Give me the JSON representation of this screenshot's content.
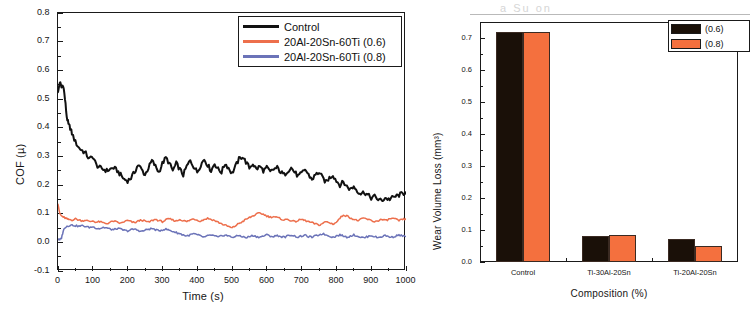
{
  "figure": {
    "ghost_text": "a Su on",
    "panels": [
      "cof-line-chart",
      "wear-bar-chart"
    ]
  },
  "chart_data": [
    {
      "type": "line",
      "id": "cof-vs-time",
      "title": "",
      "xlabel": "Time (s)",
      "ylabel": "COF (µ)",
      "xlim": [
        0,
        1000
      ],
      "ylim": [
        -0.1,
        0.8
      ],
      "xticks": [
        0,
        100,
        200,
        300,
        400,
        500,
        600,
        700,
        800,
        900,
        1000
      ],
      "xticklabels": [
        "0",
        "100",
        "200",
        "300",
        "400",
        "500",
        "600",
        "700",
        "800",
        "900",
        "1000"
      ],
      "yticks": [
        -0.1,
        0.0,
        0.1,
        0.2,
        0.3,
        0.4,
        0.5,
        0.6,
        0.7,
        0.8
      ],
      "yticklabels": [
        "-0.1",
        "0.0",
        "0.1",
        "0.2",
        "0.3",
        "0.4",
        "0.5",
        "0.6",
        "0.7",
        "0.8"
      ],
      "grid": false,
      "legend_position": "top-right",
      "series": [
        {
          "name": "Control",
          "color": "#111111",
          "x": [
            0,
            5,
            10,
            15,
            20,
            25,
            30,
            35,
            40,
            50,
            60,
            70,
            80,
            90,
            100,
            110,
            120,
            130,
            140,
            150,
            160,
            170,
            180,
            190,
            200,
            210,
            220,
            230,
            240,
            250,
            260,
            270,
            280,
            290,
            300,
            310,
            320,
            330,
            340,
            350,
            360,
            370,
            380,
            390,
            400,
            410,
            420,
            430,
            440,
            450,
            460,
            470,
            480,
            490,
            500,
            510,
            520,
            530,
            540,
            550,
            560,
            570,
            580,
            590,
            600,
            610,
            620,
            630,
            640,
            650,
            660,
            670,
            680,
            690,
            700,
            710,
            720,
            730,
            740,
            750,
            760,
            770,
            780,
            790,
            800,
            810,
            820,
            830,
            840,
            850,
            860,
            870,
            880,
            890,
            900,
            910,
            920,
            930,
            940,
            950,
            960,
            970,
            980,
            990,
            1000
          ],
          "y": [
            0.52,
            0.56,
            0.54,
            0.55,
            0.5,
            0.44,
            0.41,
            0.4,
            0.38,
            0.35,
            0.33,
            0.32,
            0.31,
            0.29,
            0.3,
            0.27,
            0.26,
            0.255,
            0.25,
            0.255,
            0.26,
            0.25,
            0.235,
            0.22,
            0.215,
            0.225,
            0.245,
            0.27,
            0.255,
            0.235,
            0.26,
            0.285,
            0.265,
            0.245,
            0.275,
            0.295,
            0.275,
            0.25,
            0.275,
            0.255,
            0.235,
            0.265,
            0.285,
            0.265,
            0.245,
            0.27,
            0.29,
            0.27,
            0.25,
            0.275,
            0.255,
            0.245,
            0.275,
            0.26,
            0.24,
            0.265,
            0.29,
            0.3,
            0.28,
            0.26,
            0.275,
            0.255,
            0.265,
            0.25,
            0.26,
            0.245,
            0.255,
            0.26,
            0.245,
            0.235,
            0.25,
            0.26,
            0.245,
            0.23,
            0.24,
            0.255,
            0.235,
            0.22,
            0.235,
            0.245,
            0.225,
            0.21,
            0.225,
            0.235,
            0.215,
            0.2,
            0.21,
            0.195,
            0.185,
            0.195,
            0.18,
            0.17,
            0.175,
            0.165,
            0.155,
            0.16,
            0.15,
            0.145,
            0.155,
            0.15,
            0.155,
            0.16,
            0.165,
            0.17,
            0.175
          ]
        },
        {
          "name": "20Al-20Sn-60Ti (0.6)",
          "color": "#ED6F4C",
          "x": [
            0,
            5,
            10,
            15,
            20,
            25,
            30,
            40,
            50,
            60,
            70,
            80,
            90,
            100,
            110,
            120,
            130,
            140,
            150,
            160,
            170,
            180,
            190,
            200,
            210,
            220,
            230,
            240,
            250,
            260,
            270,
            280,
            290,
            300,
            310,
            320,
            330,
            340,
            350,
            360,
            370,
            380,
            390,
            400,
            410,
            420,
            430,
            440,
            450,
            460,
            470,
            480,
            490,
            500,
            510,
            520,
            530,
            540,
            550,
            560,
            570,
            580,
            590,
            600,
            610,
            620,
            630,
            640,
            650,
            660,
            670,
            680,
            690,
            700,
            710,
            720,
            730,
            740,
            750,
            760,
            770,
            780,
            790,
            800,
            810,
            820,
            830,
            840,
            850,
            860,
            870,
            880,
            890,
            900,
            910,
            920,
            930,
            940,
            950,
            960,
            970,
            980,
            990,
            1000
          ],
          "y": [
            0.135,
            0.1,
            0.092,
            0.088,
            0.085,
            0.082,
            0.08,
            0.078,
            0.082,
            0.078,
            0.075,
            0.078,
            0.072,
            0.075,
            0.07,
            0.072,
            0.068,
            0.065,
            0.07,
            0.074,
            0.07,
            0.066,
            0.072,
            0.076,
            0.072,
            0.068,
            0.074,
            0.078,
            0.074,
            0.07,
            0.076,
            0.08,
            0.076,
            0.072,
            0.078,
            0.082,
            0.078,
            0.074,
            0.08,
            0.076,
            0.072,
            0.078,
            0.082,
            0.078,
            0.074,
            0.08,
            0.084,
            0.08,
            0.076,
            0.07,
            0.065,
            0.06,
            0.055,
            0.05,
            0.058,
            0.066,
            0.072,
            0.08,
            0.086,
            0.092,
            0.098,
            0.102,
            0.098,
            0.092,
            0.088,
            0.09,
            0.086,
            0.082,
            0.078,
            0.08,
            0.076,
            0.072,
            0.076,
            0.08,
            0.076,
            0.072,
            0.068,
            0.064,
            0.06,
            0.066,
            0.072,
            0.068,
            0.064,
            0.07,
            0.084,
            0.096,
            0.092,
            0.086,
            0.08,
            0.076,
            0.08,
            0.084,
            0.08,
            0.076,
            0.072,
            0.076,
            0.08,
            0.076,
            0.08,
            0.084,
            0.08,
            0.076,
            0.08,
            0.082
          ]
        },
        {
          "name": "20Al-20Sn-60Ti (0.8)",
          "color": "#6B73B8",
          "x": [
            0,
            5,
            10,
            15,
            20,
            25,
            30,
            40,
            50,
            60,
            70,
            80,
            90,
            100,
            110,
            120,
            130,
            140,
            150,
            160,
            170,
            180,
            190,
            200,
            210,
            220,
            230,
            240,
            250,
            260,
            270,
            280,
            290,
            300,
            310,
            320,
            330,
            340,
            350,
            360,
            370,
            380,
            390,
            400,
            410,
            420,
            430,
            440,
            450,
            460,
            470,
            480,
            490,
            500,
            510,
            520,
            530,
            540,
            550,
            560,
            570,
            580,
            590,
            600,
            610,
            620,
            630,
            640,
            650,
            660,
            670,
            680,
            690,
            700,
            710,
            720,
            730,
            740,
            750,
            760,
            770,
            780,
            790,
            800,
            810,
            820,
            830,
            840,
            850,
            860,
            870,
            880,
            890,
            900,
            910,
            920,
            930,
            940,
            950,
            960,
            970,
            980,
            990,
            1000
          ],
          "y": [
            0.012,
            0.008,
            0.015,
            0.04,
            0.052,
            0.056,
            0.058,
            0.06,
            0.058,
            0.056,
            0.058,
            0.055,
            0.052,
            0.054,
            0.05,
            0.048,
            0.052,
            0.05,
            0.046,
            0.044,
            0.048,
            0.046,
            0.042,
            0.04,
            0.044,
            0.046,
            0.042,
            0.038,
            0.042,
            0.046,
            0.048,
            0.044,
            0.04,
            0.044,
            0.046,
            0.042,
            0.038,
            0.034,
            0.03,
            0.026,
            0.022,
            0.026,
            0.03,
            0.026,
            0.022,
            0.018,
            0.022,
            0.026,
            0.022,
            0.018,
            0.022,
            0.026,
            0.022,
            0.018,
            0.02,
            0.024,
            0.02,
            0.016,
            0.02,
            0.024,
            0.02,
            0.018,
            0.022,
            0.026,
            0.022,
            0.02,
            0.024,
            0.02,
            0.018,
            0.022,
            0.026,
            0.022,
            0.018,
            0.022,
            0.024,
            0.02,
            0.018,
            0.022,
            0.026,
            0.03,
            0.026,
            0.022,
            0.018,
            0.022,
            0.026,
            0.022,
            0.018,
            0.022,
            0.026,
            0.022,
            0.018,
            0.016,
            0.02,
            0.024,
            0.02,
            0.016,
            0.02,
            0.024,
            0.02,
            0.018,
            0.022,
            0.026,
            0.022,
            0.02
          ]
        }
      ]
    },
    {
      "type": "bar",
      "id": "wear-volume-loss",
      "title": "",
      "xlabel": "Composition (%)",
      "ylabel": "Wear Volume Loss (mm³)",
      "categories": [
        "Control",
        "Ti-30Al-20Sn",
        "Ti-20Al-20Sn"
      ],
      "ylim": [
        0.0,
        0.75
      ],
      "yticks": [
        0.0,
        0.1,
        0.2,
        0.3,
        0.4,
        0.5,
        0.6,
        0.7
      ],
      "yticklabels": [
        "0.0",
        "0.1",
        "0.2",
        "0.3",
        "0.4",
        "0.5",
        "0.6",
        "0.7"
      ],
      "grid": false,
      "legend_position": "top-right",
      "series": [
        {
          "name": "(0.6)",
          "color": "#1A1008",
          "values": [
            0.72,
            0.08,
            0.071
          ]
        },
        {
          "name": "(0.8)",
          "color": "#F4703E",
          "values": [
            0.72,
            0.084,
            0.05
          ]
        }
      ]
    }
  ],
  "cof_legend": {
    "items": [
      {
        "label": "Control",
        "color": "#111111"
      },
      {
        "label": "20Al-20Sn-60Ti (0.6)",
        "color": "#ED6F4C"
      },
      {
        "label": "20Al-20Sn-60Ti (0.8)",
        "color": "#6B73B8"
      }
    ]
  },
  "wear_legend": {
    "items": [
      {
        "label": "(0.6)",
        "color": "#1A1008"
      },
      {
        "label": "(0.8)",
        "color": "#F4703E"
      }
    ]
  }
}
